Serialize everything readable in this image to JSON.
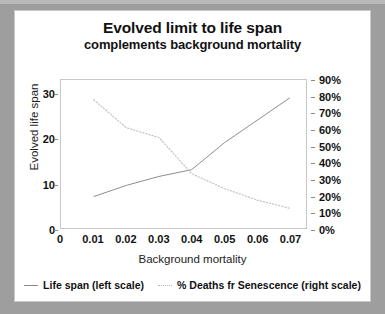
{
  "card": {
    "title_main": "Evolved limit to life span",
    "title_sub": "complements background mortality"
  },
  "chart_data": {
    "type": "line",
    "title": "Evolved limit to life span complements background mortality",
    "subtitle": "complements background mortality",
    "xlabel": "Background mortality",
    "ylabel": "Evolved life span",
    "y2label": "",
    "xlim": [
      0,
      0.075
    ],
    "ylim": [
      0,
      33
    ],
    "y2lim": [
      0,
      0.9
    ],
    "grid": false,
    "legend_position": "bottom",
    "x_ticks": [
      "0",
      "0.01",
      "0.02",
      "0.03",
      "0.04",
      "0.05",
      "0.06",
      "0.07"
    ],
    "x_tick_values": [
      0,
      0.01,
      0.02,
      0.03,
      0.04,
      0.05,
      0.06,
      0.07
    ],
    "y_ticks": [
      "0",
      "10",
      "20",
      "30"
    ],
    "y_tick_values": [
      0,
      10,
      20,
      30
    ],
    "y2_ticks": [
      "0%",
      "10%",
      "20%",
      "30%",
      "40%",
      "50%",
      "60%",
      "70%",
      "80%",
      "90%"
    ],
    "y2_tick_values": [
      0,
      10,
      20,
      30,
      40,
      50,
      60,
      70,
      80,
      90
    ],
    "x": [
      0.01,
      0.02,
      0.03,
      0.04,
      0.05,
      0.06,
      0.07
    ],
    "series": [
      {
        "name": "Life span  (left scale)",
        "axis": "left",
        "style": "solid",
        "color": "#8c8c8c",
        "values": [
          7,
          9.5,
          11.5,
          13,
          19,
          24,
          29
        ]
      },
      {
        "name": "% Deaths fr Senescence  (right scale)",
        "axis": "right",
        "style": "dotted",
        "color": "#c0c0c0",
        "values": [
          78,
          61,
          55,
          33,
          24,
          17,
          12
        ]
      }
    ]
  },
  "legend": {
    "items": [
      {
        "label": "Life span  (left scale)",
        "style": "solid"
      },
      {
        "label": "% Deaths fr Senescence  (right scale)",
        "style": "dotted"
      }
    ]
  }
}
